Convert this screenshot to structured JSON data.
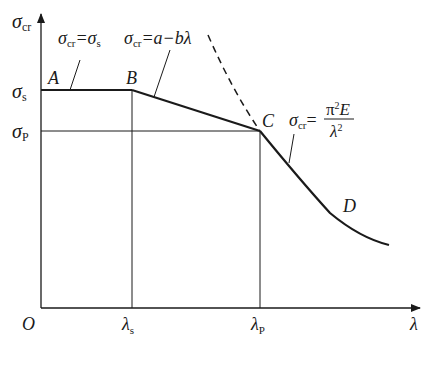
{
  "diagram": {
    "axes": {
      "y_label": "σ",
      "y_label_sub": "cr",
      "x_label": "λ",
      "origin": "O"
    },
    "y_ticks": [
      {
        "sym": "σ",
        "sub": "s"
      },
      {
        "sym": "σ",
        "sub": "P"
      }
    ],
    "x_ticks": [
      {
        "sym": "λ",
        "sub": "s"
      },
      {
        "sym": "λ",
        "sub": "P"
      }
    ],
    "points": [
      "A",
      "B",
      "C",
      "D"
    ],
    "formulas": {
      "plateau": {
        "lhs": "σ",
        "lhs_sub": "cr",
        "eq": "=σ",
        "rhs_sub": "s"
      },
      "linear": {
        "lhs": "σ",
        "lhs_sub": "cr",
        "rhs": "=a−bλ"
      },
      "euler": {
        "lhs": "σ",
        "lhs_sub": "cr",
        "eq": "=",
        "num": "π",
        "num_sup": "2",
        "num_tail": "E",
        "den": "λ",
        "den_sup": "2"
      }
    },
    "colors": {
      "line": "#1a1a1a",
      "background": "#ffffff"
    }
  }
}
